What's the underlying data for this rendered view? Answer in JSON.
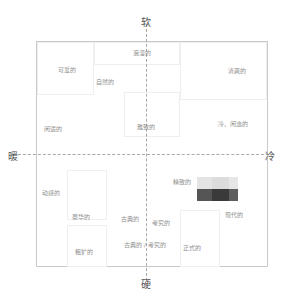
{
  "axes": {
    "top": "软",
    "bottom": "硬",
    "left": "暖",
    "right": "冷"
  },
  "terms": [
    {
      "label": "浪漫的",
      "x": 133,
      "y": 48
    },
    {
      "label": "可爱的",
      "x": 58,
      "y": 65
    },
    {
      "label": "自然的",
      "x": 96,
      "y": 77
    },
    {
      "label": "清爽的",
      "x": 228,
      "y": 66
    },
    {
      "label": "闲适的",
      "x": 44,
      "y": 124
    },
    {
      "label": "雅致的",
      "x": 137,
      "y": 122
    },
    {
      "label": "冷、闲逸的",
      "x": 218,
      "y": 119
    },
    {
      "label": "精致的",
      "x": 173,
      "y": 177
    },
    {
      "label": "动感的",
      "x": 42,
      "y": 188
    },
    {
      "label": "豪华的",
      "x": 72,
      "y": 212
    },
    {
      "label": "古典的",
      "x": 121,
      "y": 214
    },
    {
      "label": "考究的",
      "x": 152,
      "y": 218
    },
    {
      "label": "现代的",
      "x": 225,
      "y": 210
    },
    {
      "label": "古典的 / 考究的",
      "x": 124,
      "y": 240
    },
    {
      "label": "正式的",
      "x": 183,
      "y": 243
    },
    {
      "label": "粗犷的",
      "x": 75,
      "y": 247
    }
  ],
  "swatches": {
    "top_row": [
      "#e4e4e4",
      "#dcdcdc",
      "#e6e6e6"
    ],
    "bottom_row": [
      "#555555",
      "#3a3a3a",
      "#5e5e5e"
    ]
  }
}
